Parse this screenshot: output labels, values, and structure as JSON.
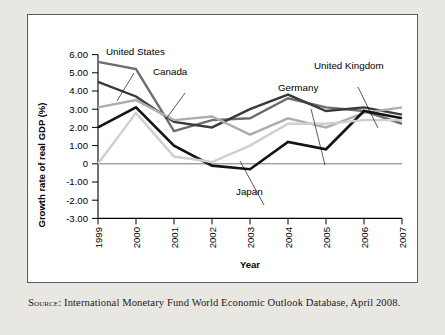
{
  "figure": {
    "source_prefix": "Source:",
    "source_text": " International Monetary Fund World Economic Outlook Database, April 2008."
  },
  "chart_data": {
    "type": "line",
    "title": "",
    "xlabel": "Year",
    "ylabel": "Growth rate of real GDP (%)",
    "categories": [
      "1999",
      "2000",
      "2001",
      "2002",
      "2003",
      "2004",
      "2005",
      "2006",
      "2007"
    ],
    "x": [
      1999,
      2000,
      2001,
      2002,
      2003,
      2004,
      2005,
      2006,
      2007
    ],
    "ylim": [
      -3.0,
      6.0
    ],
    "ytick_labels": [
      "6.00",
      "5.00",
      "4.00",
      "3.00",
      "2.00",
      "1.00",
      "0",
      "-1.00",
      "-2.00",
      "-3.00"
    ],
    "ytick_values": [
      6,
      5,
      4,
      3,
      2,
      1,
      0,
      -1,
      -2,
      -3
    ],
    "grid": false,
    "legend": "annotations-with-leader-lines",
    "series": [
      {
        "name": "United States",
        "color": "#6d6d6d",
        "width": 2.4,
        "values": [
          5.6,
          5.2,
          1.8,
          2.4,
          2.5,
          3.6,
          3.1,
          2.9,
          2.2
        ]
      },
      {
        "name": "Canada",
        "color": "#3a3a3a",
        "width": 2.4,
        "values": [
          4.5,
          3.7,
          2.3,
          2.0,
          3.0,
          3.8,
          2.9,
          3.1,
          2.7
        ]
      },
      {
        "name": "United Kingdom",
        "color": "#adadad",
        "width": 2.4,
        "values": [
          3.1,
          3.5,
          2.4,
          2.6,
          1.6,
          2.5,
          2.0,
          2.8,
          3.1
        ]
      },
      {
        "name": "Germany",
        "color": "#141414",
        "width": 2.6,
        "values": [
          2.0,
          3.1,
          1.0,
          -0.1,
          -0.3,
          1.2,
          0.8,
          2.9,
          2.5
        ]
      },
      {
        "name": "Japan",
        "color": "#cfcfcf",
        "width": 2.4,
        "values": [
          0.0,
          2.8,
          0.4,
          0.1,
          1.0,
          2.2,
          2.2,
          2.4,
          2.4
        ]
      }
    ],
    "annotations": [
      {
        "label": "United States",
        "x": 105,
        "y": 54
      },
      {
        "label": "Canada",
        "x": 152,
        "y": 74
      },
      {
        "label": "Germany",
        "x": 277,
        "y": 90
      },
      {
        "label": "United Kingdom",
        "x": 313,
        "y": 68
      },
      {
        "label": "Japan",
        "x": 235,
        "y": 194
      }
    ]
  }
}
